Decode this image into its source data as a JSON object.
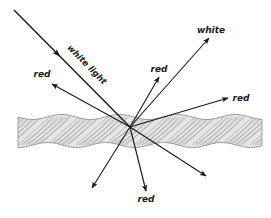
{
  "diagram": {
    "colors": {
      "ink": "#1a1a1a",
      "rope_stroke": "#8a8a8a",
      "rope_fill": "#e6e6e6",
      "background": "#ffffff"
    },
    "incoming": {
      "label": "white light",
      "from": [
        14,
        10
      ],
      "to": [
        130,
        127
      ]
    },
    "focus": [
      130,
      127
    ],
    "rays": [
      {
        "id": "upper-left",
        "label": "red",
        "to": [
          52,
          84
        ],
        "label_pos": [
          42,
          77
        ]
      },
      {
        "id": "up",
        "label": "red",
        "to": [
          159,
          77
        ],
        "label_pos": [
          159,
          72
        ]
      },
      {
        "id": "upper-right",
        "label": "white",
        "to": [
          209,
          38
        ],
        "label_pos": [
          211,
          33
        ]
      },
      {
        "id": "right",
        "label": "red",
        "to": [
          228,
          98
        ],
        "label_pos": [
          241,
          101
        ]
      },
      {
        "id": "lower-right",
        "label": "",
        "to": [
          206,
          176
        ],
        "label_pos": null
      },
      {
        "id": "lower-left",
        "label": "",
        "to": [
          92,
          188
        ],
        "label_pos": null
      },
      {
        "id": "down",
        "label": "red",
        "to": [
          146,
          191
        ],
        "label_pos": [
          146,
          202
        ]
      }
    ],
    "rope": {
      "x_start": 18,
      "x_end": 262,
      "y_center": 131,
      "half_height": 17
    }
  }
}
